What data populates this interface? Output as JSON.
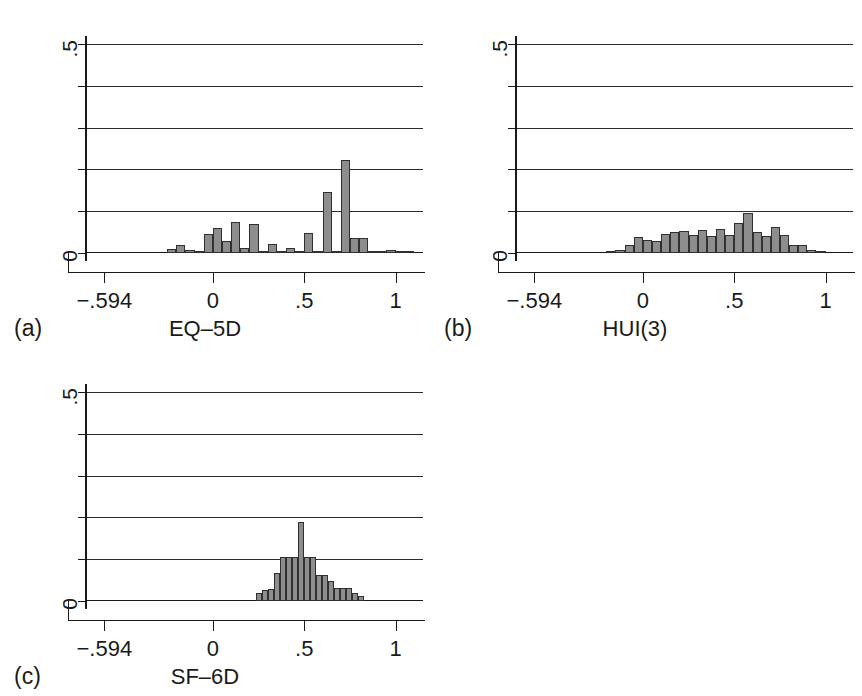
{
  "figure": {
    "background": "#ffffff",
    "bar_fill": "#8d8d8d",
    "bar_stroke": "#303030",
    "axis_color": "#1a1a1a",
    "grid_color": "#2b2b2b"
  },
  "panels": [
    {
      "caption": "(a)",
      "axis_title": "EQ–5D",
      "y_label_top": ".5",
      "y_label_bottom": "0",
      "x_ticklabels": [
        "−.594",
        "0",
        ".5",
        "1"
      ]
    },
    {
      "caption": "(b)",
      "axis_title": "HUI(3)",
      "y_label_top": ".5",
      "y_label_bottom": "0",
      "x_ticklabels": [
        "−.594",
        "0",
        ".5",
        "1"
      ]
    },
    {
      "caption": "(c)",
      "axis_title": "SF–6D",
      "y_label_top": ".5",
      "y_label_bottom": "0",
      "x_ticklabels": [
        "−.594",
        "0",
        ".5",
        "1"
      ]
    }
  ],
  "chart_data": [
    {
      "type": "bar",
      "title": "EQ-5D",
      "subtitle": "(a)",
      "xlabel": "EQ–5D",
      "ylabel": "Fraction",
      "xlim": [
        -0.7,
        1.15
      ],
      "ylim": [
        0,
        0.5
      ],
      "x_ticks": [
        -0.594,
        0,
        0.5,
        1
      ],
      "x_ticklabels": [
        "−.594",
        "0",
        ".5",
        "1"
      ],
      "y_ticks": [
        0,
        0.1,
        0.2,
        0.3,
        0.4,
        0.5
      ],
      "y_ticklabels": [
        "0",
        "",
        "",
        "",
        "",
        ".5"
      ],
      "grid": "horizontal",
      "legend": "none",
      "bin_width": 0.05,
      "bin_left_edges": [
        -0.25,
        -0.2,
        -0.15,
        -0.1,
        -0.05,
        0.0,
        0.05,
        0.1,
        0.15,
        0.2,
        0.25,
        0.3,
        0.35,
        0.4,
        0.45,
        0.5,
        0.55,
        0.6,
        0.65,
        0.7,
        0.75,
        0.8,
        0.85,
        0.9,
        0.95,
        1.0,
        1.05
      ],
      "values": [
        0.01,
        0.018,
        0.008,
        0.006,
        0.045,
        0.06,
        0.028,
        0.075,
        0.012,
        0.07,
        0.005,
        0.022,
        0.003,
        0.012,
        0.002,
        0.048,
        0.003,
        0.145,
        0.005,
        0.222,
        0.035,
        0.035,
        0.003,
        0.002,
        0.008,
        0.002,
        0.002
      ]
    },
    {
      "type": "bar",
      "title": "HUI(3)",
      "subtitle": "(b)",
      "xlabel": "HUI(3)",
      "ylabel": "Fraction",
      "xlim": [
        -0.7,
        1.15
      ],
      "ylim": [
        0,
        0.5
      ],
      "x_ticks": [
        -0.594,
        0,
        0.5,
        1
      ],
      "x_ticklabels": [
        "−.594",
        "0",
        ".5",
        "1"
      ],
      "y_ticks": [
        0,
        0.1,
        0.2,
        0.3,
        0.4,
        0.5
      ],
      "y_ticklabels": [
        "0",
        "",
        "",
        "",
        "",
        ".5"
      ],
      "grid": "horizontal",
      "legend": "none",
      "bin_width": 0.05,
      "bin_left_edges": [
        -0.2,
        -0.15,
        -0.1,
        -0.05,
        0.0,
        0.05,
        0.1,
        0.15,
        0.2,
        0.25,
        0.3,
        0.35,
        0.4,
        0.45,
        0.5,
        0.55,
        0.6,
        0.65,
        0.7,
        0.75,
        0.8,
        0.85,
        0.9,
        0.95
      ],
      "values": [
        0.006,
        0.008,
        0.02,
        0.038,
        0.03,
        0.028,
        0.045,
        0.05,
        0.052,
        0.042,
        0.055,
        0.04,
        0.058,
        0.044,
        0.072,
        0.095,
        0.05,
        0.04,
        0.062,
        0.042,
        0.02,
        0.018,
        0.008,
        0.004
      ]
    },
    {
      "type": "bar",
      "title": "SF-6D",
      "subtitle": "(c)",
      "xlabel": "SF–6D",
      "ylabel": "Fraction",
      "xlim": [
        -0.7,
        1.15
      ],
      "ylim": [
        0,
        0.5
      ],
      "x_ticks": [
        -0.594,
        0,
        0.5,
        1
      ],
      "x_ticklabels": [
        "−.594",
        "0",
        ".5",
        "1"
      ],
      "y_ticks": [
        0,
        0.1,
        0.2,
        0.3,
        0.4,
        0.5
      ],
      "y_ticklabels": [
        "0",
        "",
        "",
        "",
        "",
        ".5"
      ],
      "grid": "horizontal",
      "legend": "none",
      "bin_width": 0.033,
      "bin_left_edges": [
        0.235,
        0.268,
        0.301,
        0.334,
        0.367,
        0.4,
        0.433,
        0.466,
        0.499,
        0.532,
        0.565,
        0.598,
        0.631,
        0.664,
        0.697,
        0.73,
        0.763,
        0.796
      ],
      "values": [
        0.018,
        0.026,
        0.028,
        0.068,
        0.105,
        0.105,
        0.105,
        0.19,
        0.105,
        0.105,
        0.062,
        0.062,
        0.048,
        0.03,
        0.03,
        0.03,
        0.018,
        0.012
      ]
    }
  ]
}
